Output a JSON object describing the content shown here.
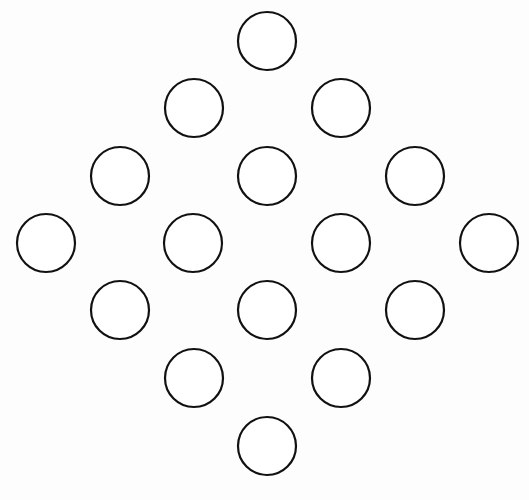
{
  "diagram": {
    "stroke_color": "#111111",
    "fill_color": "#ffffff",
    "radius": 29,
    "stroke_width": 2.2,
    "circles": [
      {
        "x": 267,
        "y": 41
      },
      {
        "x": 194,
        "y": 108
      },
      {
        "x": 341,
        "y": 108
      },
      {
        "x": 120,
        "y": 176
      },
      {
        "x": 267,
        "y": 176
      },
      {
        "x": 415,
        "y": 176
      },
      {
        "x": 46,
        "y": 243
      },
      {
        "x": 193,
        "y": 243
      },
      {
        "x": 341,
        "y": 243
      },
      {
        "x": 489,
        "y": 243
      },
      {
        "x": 120,
        "y": 310
      },
      {
        "x": 267,
        "y": 310
      },
      {
        "x": 415,
        "y": 310
      },
      {
        "x": 194,
        "y": 378
      },
      {
        "x": 341,
        "y": 378
      },
      {
        "x": 267,
        "y": 446
      }
    ]
  }
}
